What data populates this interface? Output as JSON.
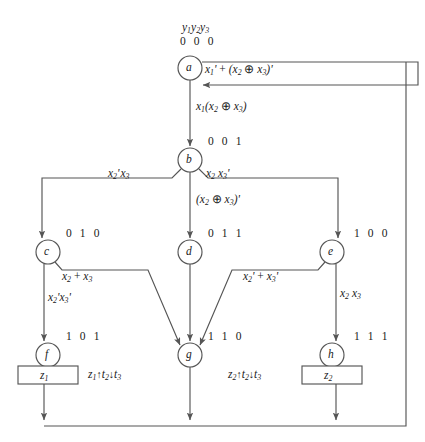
{
  "diagram": {
    "title_header": "y1y2y3",
    "type": "state-transition-flow-diagram",
    "stroke_color": "#555555",
    "text_color": "#1a1a1a",
    "states": [
      {
        "id": "a",
        "letter": "a",
        "code": "0 0 0",
        "cx": 190,
        "cy": 68
      },
      {
        "id": "b",
        "letter": "b",
        "code": "0 0 1",
        "cx": 190,
        "cy": 160
      },
      {
        "id": "c",
        "letter": "c",
        "code": "0 1 0",
        "cx": 48,
        "cy": 252
      },
      {
        "id": "d",
        "letter": "d",
        "code": "0 1 1",
        "cx": 190,
        "cy": 252
      },
      {
        "id": "e",
        "letter": "e",
        "code": "1 0 0",
        "cx": 332,
        "cy": 252
      },
      {
        "id": "f",
        "letter": "f",
        "code": "1 0 1",
        "cx": 48,
        "cy": 355
      },
      {
        "id": "g",
        "letter": "g",
        "code": "1 1 0",
        "cx": 190,
        "cy": 355
      },
      {
        "id": "h",
        "letter": "h",
        "code": "1 1 1",
        "cx": 332,
        "cy": 355
      }
    ],
    "output_boxes": [
      {
        "id": "z1box",
        "label": "z1",
        "x": 18,
        "y": 366,
        "w": 60,
        "h": 18
      },
      {
        "id": "z2box",
        "label": "z2",
        "x": 302,
        "y": 366,
        "w": 60,
        "h": 18
      }
    ],
    "timing_labels": [
      {
        "id": "t1",
        "signal": "z1",
        "text": "z1↑t2↓t3",
        "x": 88,
        "y": 369
      },
      {
        "id": "t2",
        "signal": "z2",
        "text": "z2↑t2↓t3",
        "x": 228,
        "y": 369
      }
    ],
    "conditions": [
      {
        "id": "cond-a-self",
        "text": "x1' + (x2 ⊕ x3)'",
        "x": 205,
        "y": 64,
        "from": "a",
        "to": "a"
      },
      {
        "id": "cond-a-b",
        "text": "x1(x2 ⊕ x3)",
        "x": 196,
        "y": 101,
        "from": "a",
        "to": "b"
      },
      {
        "id": "cond-b-c",
        "text": "x2' x3",
        "x": 108,
        "y": 168,
        "from": "b",
        "to": "c"
      },
      {
        "id": "cond-b-e",
        "text": "x2 x3'",
        "x": 206,
        "y": 168,
        "from": "b",
        "to": "e"
      },
      {
        "id": "cond-b-d",
        "text": "(x2 ⊕ x3)'",
        "x": 196,
        "y": 194,
        "from": "b",
        "to": "d"
      },
      {
        "id": "cond-c-g",
        "text": "x2 + x3",
        "x": 62,
        "y": 271,
        "from": "c",
        "to": "g"
      },
      {
        "id": "cond-c-f",
        "text": "x2' x3'",
        "x": 48,
        "y": 292,
        "from": "c",
        "to": "f"
      },
      {
        "id": "cond-e-g",
        "text": "x2' + x3'",
        "x": 243,
        "y": 271,
        "from": "e",
        "to": "g"
      },
      {
        "id": "cond-e-h",
        "text": "x2 x3",
        "x": 340,
        "y": 288,
        "from": "e",
        "to": "h"
      }
    ]
  }
}
